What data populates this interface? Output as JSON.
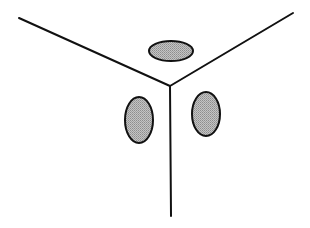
{
  "diagram": {
    "type": "trihedral-corner-with-three-faces",
    "background": "#ffffff",
    "stroke_color": "#111111",
    "fill_color": "#b4b4b4",
    "vertex": {
      "x": 170,
      "y": 86
    },
    "edges": [
      {
        "name": "left-edge",
        "x1": 19,
        "y1": 18,
        "x2": 170,
        "y2": 86
      },
      {
        "name": "right-edge",
        "x1": 293,
        "y1": 13,
        "x2": 170,
        "y2": 86
      },
      {
        "name": "bottom-edge",
        "x1": 170,
        "y1": 86,
        "x2": 171,
        "y2": 216
      }
    ],
    "ellipses": [
      {
        "name": "top-face-ellipse",
        "cx": 171,
        "cy": 51,
        "rx": 22,
        "ry": 10
      },
      {
        "name": "left-face-ellipse",
        "cx": 139,
        "cy": 120,
        "rx": 14,
        "ry": 23
      },
      {
        "name": "right-face-ellipse",
        "cx": 206,
        "cy": 114,
        "rx": 14,
        "ry": 22
      }
    ]
  }
}
